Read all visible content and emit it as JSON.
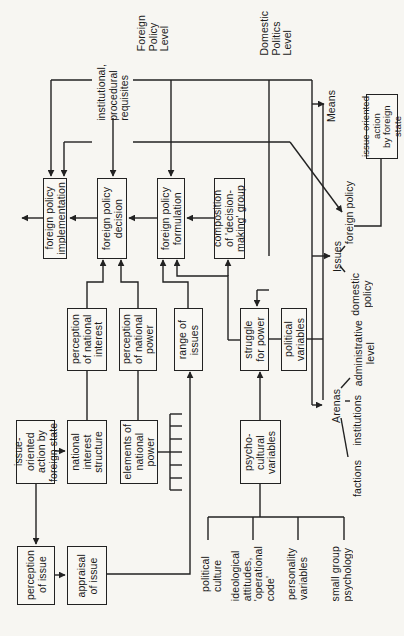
{
  "levels": {
    "foreign_policy_level": "Foreign\nPolicy\nLevel",
    "domestic_politics_level": "Domestic\nPolitics\nLevel"
  },
  "side_labels": {
    "institutional_requisites": "institutional,\nprocedural\nrequisites",
    "means": "Means",
    "issues": "Issues",
    "issues_foreign_policy": "foreign policy",
    "issues_domestic_policy": "domestic\npolicy",
    "arenas": "Arenas",
    "arenas_administrative_level": "administrative\nlevel",
    "arenas_institutions": "institutions",
    "arenas_factions": "factions"
  },
  "boxes": {
    "fp_implementation": "foreign policy\nimplementation",
    "fp_decision": "foreign policy\ndecision",
    "fp_formulation": "foreign policy\nformulation",
    "composition_group": "composition\nof 'decision-\nmaking' group",
    "perception_national_interest": "perception\nof national\ninterest",
    "perception_national_power": "perception\nof national\npower",
    "range_of_issues": "range of\nissues",
    "struggle_for_power": "struggle\nfor power",
    "political_variables": "political\nvariables",
    "issue_action_input": "issue-oriented\naction by\nforeign state",
    "national_interest_structure": "national\ninterest\nstructure",
    "elements_national_power": "elements of\nnational\npower",
    "psycho_cultural_variables": "psycho-\ncultural\nvariables",
    "perception_of_issue": "perception\nof issue",
    "appraisal_of_issue": "appraisal\nof issue",
    "issue_action_output": "issue-oriented action\nby foreign state"
  },
  "psycho_cultural_inputs": [
    "political\nculture",
    "ideological\nattitudes,\n'operational\ncode'",
    "personality\nvariables",
    "small group\npsychology"
  ],
  "colors": {
    "line": "#222222",
    "background": "#f7f6f2"
  }
}
